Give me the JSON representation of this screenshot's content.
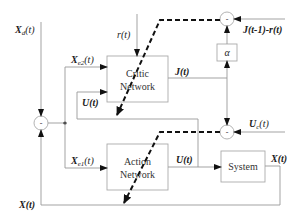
{
  "diagram": {
    "blocks": {
      "critic": {
        "line1": "Critic",
        "line2": "Network"
      },
      "action": {
        "line1": "Action",
        "line2": "Network"
      },
      "system": {
        "label": "System"
      },
      "alpha": {
        "label": "α"
      }
    },
    "summing_junctions": {
      "left": {
        "sign": "-"
      },
      "top": {
        "sign": "-"
      },
      "bottom": {
        "sign": "-"
      }
    },
    "signals": {
      "xd": {
        "main": "X",
        "sub": "d",
        "arg": "(t)"
      },
      "r": "r(t)",
      "xe2": {
        "main": "X",
        "sub": "e2",
        "arg": "(t)"
      },
      "u_critic": "U(t)",
      "j": "J(t)",
      "j_prev": "J(t-1)-r(t)",
      "uc": {
        "main": "U",
        "sub": "c",
        "arg": "(t)"
      },
      "xe1": {
        "main": "X",
        "sub": "e1",
        "arg": "(t)"
      },
      "u_action": "U(t)",
      "x_out": "X(t)",
      "x_feedback": "X(t)"
    }
  }
}
